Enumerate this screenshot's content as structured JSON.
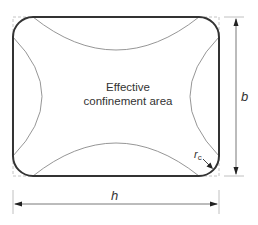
{
  "diagram": {
    "labels": {
      "center_line1": "Effective",
      "center_line2": "confinement area",
      "height_dim": "b",
      "width_dim": "h",
      "corner_radius_main": "r",
      "corner_radius_sub": "c"
    },
    "colors": {
      "section_outline": "#333333",
      "arching_curves": "#8a8a8a",
      "dimension_lines": "#555555",
      "extension_lines": "#b0b0b0",
      "text": "#333333"
    },
    "geometry": {
      "section": {
        "x": 13,
        "y": 17,
        "width": 206,
        "height": 159,
        "corner_radius": 20
      },
      "arch_top_lowest_y": 50,
      "arch_bottom_highest_y": 143,
      "arch_left_rightmost_x": 42,
      "arch_right_leftmost_x": 190
    }
  }
}
